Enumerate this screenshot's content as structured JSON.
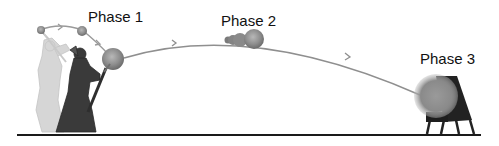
{
  "diagram": {
    "phases": [
      {
        "label": "Phase 1",
        "description": "launch"
      },
      {
        "label": "Phase 2",
        "description": "flight"
      },
      {
        "label": "Phase 3",
        "description": "impact"
      }
    ],
    "colors": {
      "ground": "#1a1a1a",
      "trajectory": "#8f8f8f",
      "ball": "#8a8a8a",
      "figure_dark": "#3a3a3a",
      "figure_light": "#d6d6d6",
      "target": "#222222"
    }
  }
}
